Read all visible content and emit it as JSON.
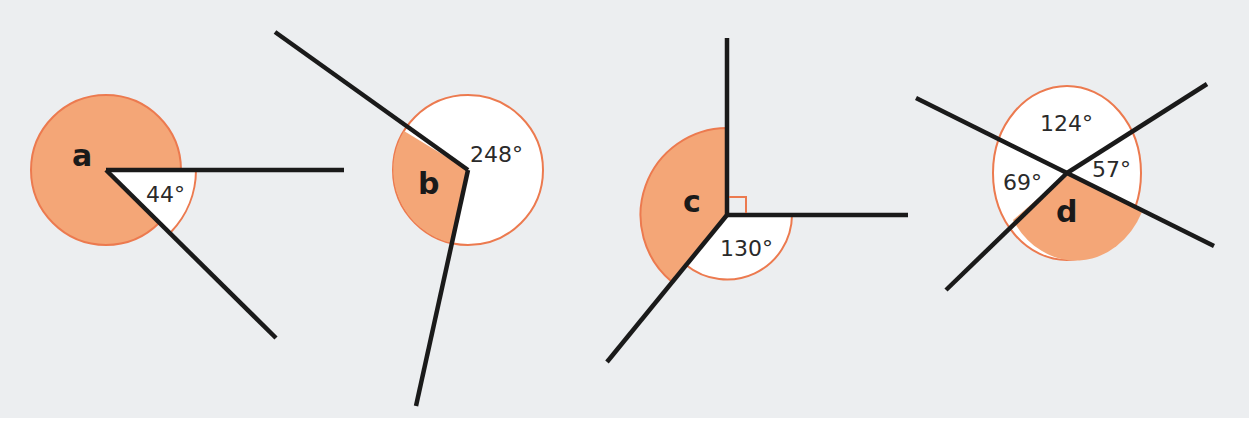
{
  "colors": {
    "background": "#eceef0",
    "shaded_sector": "#f4a677",
    "circle_outline": "#ec7a4f",
    "unshaded_sector": "#ffffff",
    "ray": "#1a1a1a"
  },
  "diagrams": [
    {
      "id": "a",
      "unknown_label": "a",
      "known_angles": [
        {
          "label": "44°",
          "value": 44
        }
      ],
      "description": "Two rays meeting at a point; the reflex angle a is shaded and the 44° angle is marked"
    },
    {
      "id": "b",
      "unknown_label": "b",
      "known_angles": [
        {
          "label": "248°",
          "value": 248
        }
      ],
      "description": "Two rays meeting at a point; the reflex angle of 248° is marked and the remaining angle b is shaded"
    },
    {
      "id": "c",
      "unknown_label": "c",
      "known_angles": [
        {
          "label": "90° (right-angle mark)",
          "value": 90
        },
        {
          "label": "130°",
          "value": 130
        }
      ],
      "description": "Three rays from one point; a right angle, a 130° angle, and the shaded angle c"
    },
    {
      "id": "d",
      "unknown_label": "d",
      "known_angles": [
        {
          "label": "124°",
          "value": 124
        },
        {
          "label": "57°",
          "value": 57
        },
        {
          "label": "69°",
          "value": 69
        }
      ],
      "description": "Four rays from one point forming angles of 124°, 57°, 69° and the shaded angle d"
    }
  ],
  "labels": {
    "a": "a",
    "a_angle": "44°",
    "b": "b",
    "b_angle": "248°",
    "c": "c",
    "c_angle": "130°",
    "d": "d",
    "d_angle_top": "124°",
    "d_angle_right": "57°",
    "d_angle_left": "69°"
  }
}
